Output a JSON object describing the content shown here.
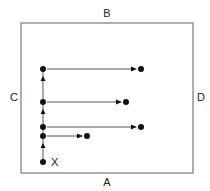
{
  "diagram": {
    "labels": {
      "top": "B",
      "bottom": "A",
      "left": "C",
      "right": "D",
      "start": "X"
    },
    "box": {
      "x1": 21,
      "y1": 23,
      "x2": 193,
      "y2": 173
    },
    "vertical_path": {
      "x": 43,
      "points_y": [
        162,
        136,
        127,
        102,
        69
      ],
      "arrowed_segments": [
        [
          162,
          136
        ],
        [
          127,
          102
        ],
        [
          102,
          69
        ]
      ]
    },
    "horizontal_arrows": [
      {
        "y": 69,
        "from_x": 43,
        "to_x": 141
      },
      {
        "y": 102,
        "from_x": 43,
        "to_x": 126
      },
      {
        "y": 127,
        "from_x": 43,
        "to_x": 141
      },
      {
        "y": 136,
        "from_x": 43,
        "to_x": 87
      }
    ],
    "colors": {
      "dot": "#111111",
      "line": "#555555",
      "box": "#7a7a7a",
      "text": "#222222"
    }
  }
}
